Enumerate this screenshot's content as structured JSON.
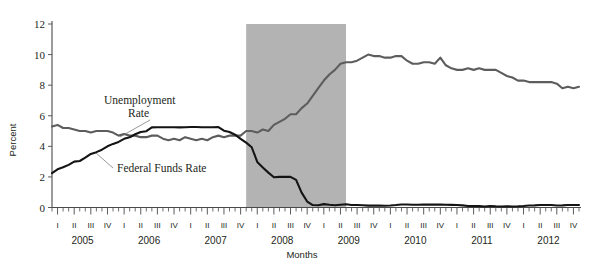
{
  "chart_data": {
    "type": "line",
    "title": "",
    "xlabel": "Months",
    "ylabel": "Percent",
    "ylim": [
      0,
      12
    ],
    "yticks": [
      0,
      2,
      4,
      6,
      8,
      10,
      12
    ],
    "grid": false,
    "legend": "inline-annotations",
    "x_quarter_labels": [
      "I",
      "II",
      "III",
      "IV"
    ],
    "x_year_labels": [
      "2005",
      "2006",
      "2007",
      "2008",
      "2009",
      "2010",
      "2011",
      "2012"
    ],
    "x_start": "2005-01",
    "x_end": "2012-12",
    "annotations": [
      {
        "name": "unemployment-rate-label",
        "text_line1": "Unemployment",
        "text_line2": "Rate"
      },
      {
        "name": "federal-funds-rate-label",
        "text": "Federal Funds Rate"
      }
    ],
    "shaded_regions": [
      {
        "name": "recession-band",
        "label": "Recession",
        "start": "2007-12",
        "end": "2009-06",
        "color": "#b3b3b3"
      }
    ],
    "series": [
      {
        "name": "Unemployment Rate",
        "color": "#5d5d5d",
        "values": [
          5.3,
          5.4,
          5.2,
          5.2,
          5.1,
          5.0,
          5.0,
          4.9,
          5.0,
          5.0,
          5.0,
          4.9,
          4.7,
          4.8,
          4.7,
          4.7,
          4.6,
          4.6,
          4.7,
          4.7,
          4.5,
          4.4,
          4.5,
          4.4,
          4.6,
          4.5,
          4.4,
          4.5,
          4.4,
          4.6,
          4.7,
          4.6,
          4.7,
          4.7,
          4.7,
          5.0,
          5.0,
          4.9,
          5.1,
          5.0,
          5.4,
          5.6,
          5.8,
          6.1,
          6.1,
          6.5,
          6.8,
          7.3,
          7.8,
          8.3,
          8.7,
          9.0,
          9.4,
          9.5,
          9.5,
          9.6,
          9.8,
          10.0,
          9.9,
          9.9,
          9.8,
          9.8,
          9.9,
          9.9,
          9.6,
          9.4,
          9.4,
          9.5,
          9.5,
          9.4,
          9.8,
          9.3,
          9.1,
          9.0,
          9.0,
          9.1,
          9.0,
          9.1,
          9.0,
          9.0,
          9.0,
          8.8,
          8.6,
          8.5,
          8.3,
          8.3,
          8.2,
          8.2,
          8.2,
          8.2,
          8.2,
          8.1,
          7.8,
          7.9,
          7.8,
          7.9
        ]
      },
      {
        "name": "Federal Funds Rate",
        "color": "#141414",
        "values": [
          2.25,
          2.5,
          2.63,
          2.79,
          3.0,
          3.04,
          3.26,
          3.5,
          3.62,
          3.78,
          4.0,
          4.16,
          4.29,
          4.49,
          4.59,
          4.79,
          4.94,
          4.99,
          5.24,
          5.25,
          5.25,
          5.25,
          5.25,
          5.24,
          5.25,
          5.26,
          5.26,
          5.25,
          5.25,
          5.25,
          5.26,
          5.02,
          4.94,
          4.76,
          4.49,
          4.24,
          3.94,
          2.98,
          2.61,
          2.28,
          1.98,
          2.0,
          2.01,
          2.0,
          1.81,
          0.97,
          0.39,
          0.16,
          0.15,
          0.22,
          0.18,
          0.15,
          0.18,
          0.21,
          0.16,
          0.16,
          0.15,
          0.12,
          0.12,
          0.12,
          0.11,
          0.13,
          0.16,
          0.2,
          0.2,
          0.18,
          0.18,
          0.19,
          0.19,
          0.19,
          0.19,
          0.18,
          0.17,
          0.16,
          0.14,
          0.1,
          0.09,
          0.09,
          0.07,
          0.1,
          0.08,
          0.07,
          0.08,
          0.07,
          0.08,
          0.1,
          0.13,
          0.14,
          0.16,
          0.16,
          0.16,
          0.13,
          0.14,
          0.16,
          0.16,
          0.16
        ]
      }
    ]
  },
  "axes": {
    "y_axis_title": "Percent",
    "x_axis_title": "Months"
  }
}
